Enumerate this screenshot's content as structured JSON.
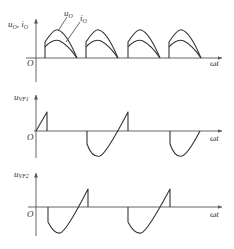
{
  "diagram": {
    "panels": [
      {
        "id": "output",
        "y_label": "u",
        "y_label_sub": "O",
        "y_label2": "i",
        "y_label2_sub": "O",
        "origin_label": "O",
        "x_label": "ωt",
        "curve_labels": [
          {
            "name": "u",
            "sub": "O"
          },
          {
            "name": "i",
            "sub": "O"
          }
        ]
      },
      {
        "id": "vf1",
        "y_label": "u",
        "y_label_sub": "VF1",
        "x_label": "ωt"
      },
      {
        "id": "vf2",
        "y_label": "u",
        "y_label_sub": "VF2",
        "origin_label": "O",
        "x_label": "ωt"
      }
    ],
    "colors": {
      "line": "#333333",
      "axis": "#555555",
      "background": "#ffffff"
    }
  }
}
